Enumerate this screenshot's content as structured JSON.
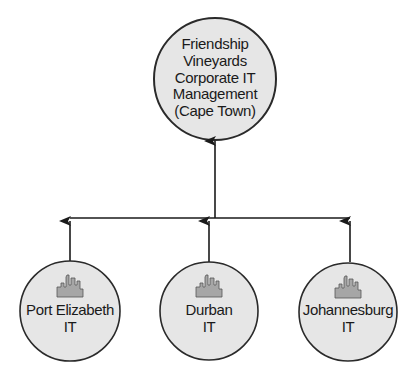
{
  "diagram": {
    "type": "org-hierarchy",
    "colors": {
      "node_fill": "#e6e6e6",
      "node_stroke": "#2a2a2a",
      "line": "#1a1a1a",
      "icon_fill": "#a6a6a6"
    },
    "root": {
      "lines": [
        "Friendship",
        "Vineyards",
        "Corporate IT",
        "Management",
        "(Cape Town)"
      ]
    },
    "children": [
      {
        "lines": [
          "Port Elizabeth",
          "IT"
        ],
        "icon": "city-skyline-icon"
      },
      {
        "lines": [
          "Durban",
          "IT"
        ],
        "icon": "city-skyline-icon"
      },
      {
        "lines": [
          "Johannesburg",
          "IT"
        ],
        "icon": "city-skyline-icon"
      }
    ]
  }
}
